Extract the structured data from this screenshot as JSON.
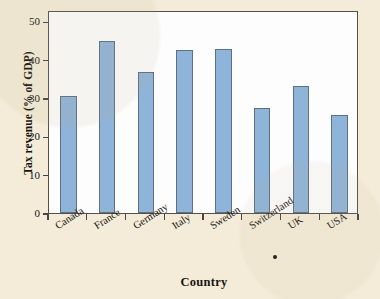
{
  "chart_data": {
    "type": "bar",
    "title": "",
    "xlabel": "Country",
    "ylabel": "Tax revenue (% of GDP)",
    "categories": [
      "Canada",
      "France",
      "Germany",
      "Italy",
      "Sweden",
      "Switzerland",
      "UK",
      "USA"
    ],
    "values": [
      30.6,
      45.0,
      36.8,
      42.6,
      42.9,
      27.3,
      33.2,
      25.7
    ],
    "ylim": [
      0,
      53
    ],
    "yticks": [
      0,
      10,
      20,
      30,
      40,
      50
    ],
    "ytick_labels": [
      "0",
      "10",
      "20",
      "30",
      "40",
      "50"
    ],
    "grid": false,
    "legend": null,
    "bar_color": "#8fb4d9",
    "bar_edge_color": "#5f6f80",
    "plot_background": "#fdfdfd",
    "figure_background": "#f4ecd8",
    "annotations": [
      {
        "name": "stray-dot",
        "text": "•"
      }
    ]
  }
}
